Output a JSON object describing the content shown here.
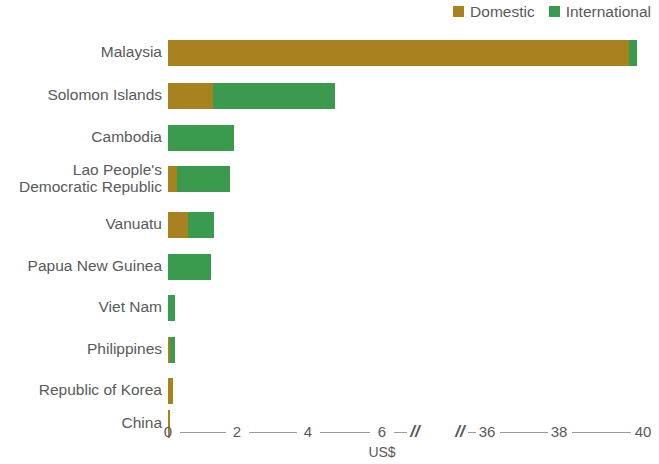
{
  "legend": {
    "items": [
      {
        "label": "Domestic",
        "color": "#a8821e",
        "icon": "square-swatch-icon"
      },
      {
        "label": "International",
        "color": "#3a9b4e",
        "icon": "square-swatch-icon"
      }
    ]
  },
  "axis": {
    "title": "US$",
    "tick_labels": [
      "0",
      "2",
      "4",
      "6",
      "36",
      "38",
      "40"
    ],
    "break_marks": [
      "//",
      "//"
    ]
  },
  "chart_data": {
    "type": "bar",
    "orientation": "horizontal",
    "stacked": true,
    "title": "",
    "subtitle": "",
    "xlabel": "US$",
    "ylabel": "",
    "xlim": [
      0,
      40
    ],
    "axis_break": [
      6.5,
      35.5
    ],
    "xticks": [
      0,
      2,
      4,
      6,
      36,
      38,
      40
    ],
    "grid": false,
    "legend_position": "top-right",
    "categories": [
      "Malaysia",
      "Solomon Islands",
      "Cambodia",
      "Lao People's\nDemocratic Republic",
      "Vanuatu",
      "Papua New Guinea",
      "Viet Nam",
      "Philippines",
      "Republic of Korea",
      "China"
    ],
    "series": [
      {
        "name": "Domestic",
        "color": "#a8821e",
        "values": [
          39.4,
          1.25,
          0.0,
          0.25,
          0.55,
          0.0,
          0.0,
          0.05,
          0.15,
          0.03
        ]
      },
      {
        "name": "International",
        "color": "#3a9b4e",
        "values": [
          0.2,
          3.45,
          1.85,
          1.5,
          0.75,
          1.2,
          0.2,
          0.15,
          0.0,
          0.0
        ]
      }
    ],
    "totals": [
      39.6,
      4.7,
      1.85,
      1.75,
      1.3,
      1.2,
      0.2,
      0.2,
      0.15,
      0.03
    ]
  }
}
